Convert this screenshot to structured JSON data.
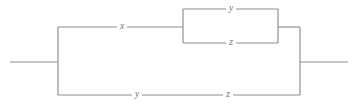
{
  "diagram": {
    "type": "series-parallel-network",
    "title": "",
    "canvas": {
      "width": 358,
      "height": 106,
      "background": "#ffffff"
    },
    "style": {
      "line_color": "#8d8d8f",
      "label_color": "#6f6f72",
      "line_width": 1.15
    },
    "terminals": {
      "left": {
        "x1": 10,
        "x2": 58,
        "y": 62
      },
      "right": {
        "x1": 300,
        "x2": 348,
        "y": 62
      }
    },
    "buses": {
      "left_x": 58,
      "right_x": 300,
      "top_y": 27,
      "bottom_y": 95
    },
    "upper_branch": {
      "y": 27,
      "segment_start_x": 58,
      "segment_end_x": 183,
      "label": "x",
      "label_x": 122,
      "label_y": 27
    },
    "inner_block": {
      "left_x": 183,
      "right_x": 278,
      "top_y": 9,
      "bottom_y": 43,
      "exit_x": 300,
      "exit_y": 27,
      "top_label": "y",
      "top_label_x": 231,
      "top_label_y": 9,
      "bottom_label": "z",
      "bottom_label_x": 231,
      "bottom_label_y": 43
    },
    "lower_branch": {
      "y": 95,
      "start_x": 58,
      "end_x": 300,
      "labels": [
        {
          "text": "y",
          "x": 137,
          "y": 95
        },
        {
          "text": "z",
          "x": 228,
          "y": 95
        }
      ]
    },
    "edge_labels": [
      {
        "name": "upper-x",
        "text": "x"
      },
      {
        "name": "inner-top-y",
        "text": "y"
      },
      {
        "name": "inner-bottom-z",
        "text": "z"
      },
      {
        "name": "lower-y",
        "text": "y"
      },
      {
        "name": "lower-z",
        "text": "z"
      }
    ]
  }
}
